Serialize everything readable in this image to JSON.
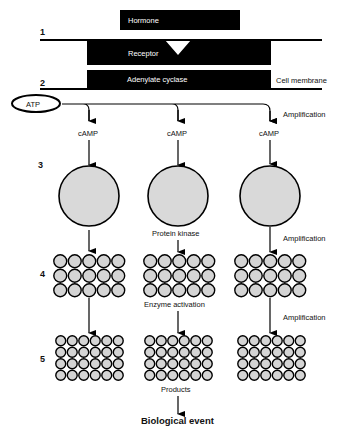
{
  "figure": {
    "step_numbers": [
      "1",
      "2",
      "3",
      "4",
      "5"
    ],
    "hormone_label": "Hormone",
    "receptor_label": "Receptor",
    "adenylate_cyclase_label": "Adenylate cyclase",
    "cell_membrane_label": "Cell membrane",
    "atp_label": "ATP",
    "camp_labels": [
      "cAMP",
      "cAMP",
      "cAMP"
    ],
    "amplification_labels": [
      "Amplification",
      "Amplification",
      "Amplification"
    ],
    "protein_kinase_label": "Protein kinase",
    "enzyme_activation_label": "Enzyme activation",
    "products_label": "Products",
    "biological_event_label": "Biological event",
    "branches": 3,
    "grid_level4": {
      "columns": 5,
      "rows": 3
    },
    "grid_level5": {
      "columns": 6,
      "rows": 4
    },
    "colors": {
      "shape_fill": "#d4d4d4",
      "ink": "#000000",
      "background": "#ffffff"
    }
  }
}
